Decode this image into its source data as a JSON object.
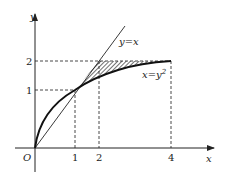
{
  "diagram": {
    "axes": {
      "x_label": "x",
      "y_label": "y",
      "origin_label": "O"
    },
    "x_ticks": [
      "1",
      "2",
      "4"
    ],
    "y_ticks": [
      "1",
      "2"
    ],
    "curves": {
      "line": "y=x",
      "parabola_base": "x=y",
      "parabola_exp": "2"
    },
    "shaded_region": "region between y=x and x=y^2 from y=1 to y=2"
  }
}
